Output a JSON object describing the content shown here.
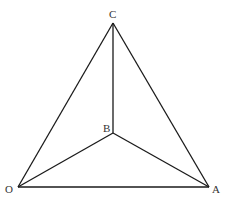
{
  "diagram": {
    "type": "tetrahedron-projection",
    "points": {
      "C": {
        "label": "C",
        "x": 113,
        "y": 23
      },
      "B": {
        "label": "B",
        "x": 113,
        "y": 133
      },
      "O": {
        "label": "O",
        "x": 18,
        "y": 187
      },
      "A": {
        "label": "A",
        "x": 209,
        "y": 187
      }
    },
    "edges": [
      [
        "O",
        "A"
      ],
      [
        "O",
        "C"
      ],
      [
        "A",
        "C"
      ],
      [
        "B",
        "C"
      ],
      [
        "B",
        "O"
      ],
      [
        "B",
        "A"
      ]
    ],
    "labels": {
      "C": "C",
      "B": "B",
      "O": "O",
      "A": "A"
    }
  }
}
